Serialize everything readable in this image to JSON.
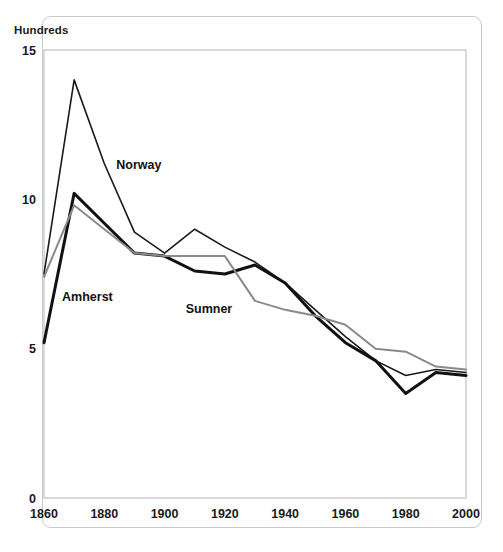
{
  "figure": {
    "title_partial": "",
    "unit_label": "Hundreds",
    "frame_color": "#c9c9c9",
    "background": "#ffffff"
  },
  "axes": {
    "y_ticks": [
      "0",
      "5",
      "10",
      "15"
    ],
    "x_ticks": [
      "1860",
      "1880",
      "1900",
      "1920",
      "1940",
      "1960",
      "1980",
      "2000"
    ]
  },
  "series_labels": {
    "norway": "Norway",
    "amherst": "Amherst",
    "sumner": "Sumner"
  },
  "chart_data": {
    "type": "line",
    "title": "",
    "xlabel": "",
    "ylabel": "Hundreds",
    "xlim": [
      1860,
      2000
    ],
    "ylim": [
      0,
      15
    ],
    "ytick_values": [
      0,
      5,
      10,
      15
    ],
    "xtick_values": [
      1860,
      1880,
      1900,
      1920,
      1940,
      1960,
      1980,
      2000
    ],
    "grid": false,
    "legend": "inline-labels",
    "x": [
      1860,
      1870,
      1880,
      1890,
      1900,
      1910,
      1920,
      1930,
      1940,
      1950,
      1960,
      1970,
      1980,
      1990,
      2000
    ],
    "series": [
      {
        "name": "Norway",
        "color": "#1a1a1a",
        "width": 1.6,
        "label_x": 1884,
        "label_y": 11.0,
        "values": [
          7.5,
          14.0,
          11.2,
          8.9,
          8.2,
          9.0,
          8.4,
          7.9,
          7.2,
          6.3,
          5.4,
          4.6,
          4.1,
          4.3,
          4.2
        ]
      },
      {
        "name": "Amherst",
        "color": "#111111",
        "width": 3.0,
        "label_x": 1866,
        "label_y": 6.6,
        "values": [
          5.2,
          10.2,
          9.2,
          8.2,
          8.1,
          7.6,
          7.5,
          7.8,
          7.2,
          6.1,
          5.2,
          4.6,
          3.5,
          4.2,
          4.1
        ]
      },
      {
        "name": "Sumner",
        "color": "#8a8a8a",
        "width": 2.0,
        "label_x": 1907,
        "label_y": 6.2,
        "values": [
          7.4,
          9.8,
          9.0,
          8.2,
          8.1,
          8.1,
          8.1,
          6.6,
          6.3,
          6.1,
          5.8,
          5.0,
          4.9,
          4.4,
          4.3
        ]
      }
    ]
  }
}
